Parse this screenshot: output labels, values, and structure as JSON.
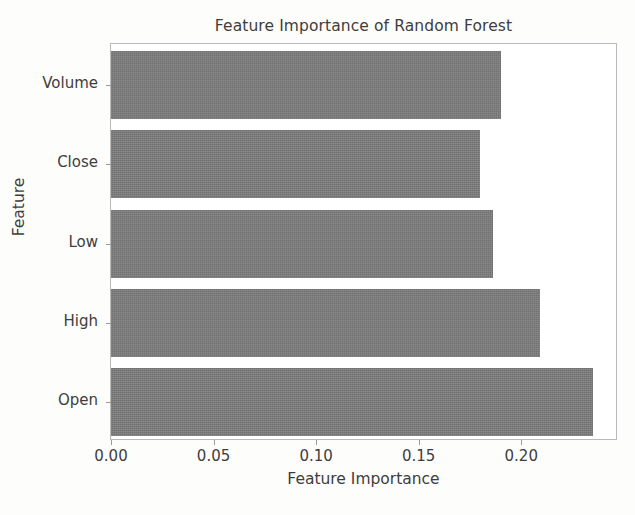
{
  "chart_data": {
    "type": "bar",
    "orientation": "horizontal",
    "title": "Feature Importance of Random Forest",
    "xlabel": "Feature Importance",
    "ylabel": "Feature",
    "categories": [
      "Open",
      "High",
      "Low",
      "Close",
      "Volume"
    ],
    "values": [
      0.235,
      0.209,
      0.186,
      0.18,
      0.19
    ],
    "categories_top_to_bottom": [
      "Volume",
      "Close",
      "Low",
      "High",
      "Open"
    ],
    "values_top_to_bottom": [
      0.19,
      0.18,
      0.186,
      0.209,
      0.235
    ],
    "xticks": [
      0.0,
      0.05,
      0.1,
      0.15,
      0.2
    ],
    "xtick_labels": [
      "0.00",
      "0.05",
      "0.10",
      "0.15",
      "0.20"
    ],
    "xlim": [
      0.0,
      0.2462
    ],
    "grid": false,
    "legend": null,
    "bar_color": "#7a7a7a",
    "axes_background": "#ffffff",
    "frame_color": "#b9b9b9",
    "text_color": "#3d3d3d",
    "bars": [
      {
        "label": "Volume",
        "value": 0.19
      },
      {
        "label": "Close",
        "value": 0.18
      },
      {
        "label": "Low",
        "value": 0.186
      },
      {
        "label": "High",
        "value": 0.209
      },
      {
        "label": "Open",
        "value": 0.235
      }
    ]
  },
  "page": {
    "caption_remnant": ""
  }
}
